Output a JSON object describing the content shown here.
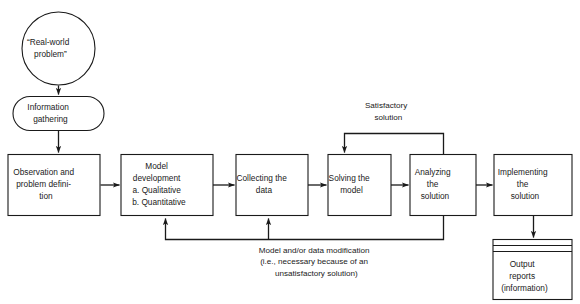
{
  "diagram": {
    "colors": {
      "stroke": "#1a1a1a",
      "fill": "#ffffff",
      "background": "#ffffff",
      "text": "#1a1a1a"
    },
    "nodes": {
      "real_world_problem": {
        "shape": "circle",
        "lines": [
          "“Real-world",
          "problem”"
        ]
      },
      "information_gathering": {
        "shape": "stadium",
        "lines": [
          "Information",
          "gathering"
        ]
      },
      "observation": {
        "shape": "rect",
        "lines": [
          "Observation and",
          "problem defini-",
          "tion"
        ]
      },
      "model_development": {
        "shape": "rect",
        "lines": [
          "Model",
          "development",
          "a. Qualitative",
          "b. Quantitative"
        ]
      },
      "collecting_data": {
        "shape": "rect",
        "lines": [
          "Collecting the",
          "data"
        ]
      },
      "solving_model": {
        "shape": "rect",
        "lines": [
          "Solving the",
          "model"
        ]
      },
      "analyzing_solution": {
        "shape": "rect",
        "lines": [
          "Analyzing",
          "the",
          "solution"
        ]
      },
      "implementing_solution": {
        "shape": "rect",
        "lines": [
          "Implementing",
          "the",
          "solution"
        ]
      },
      "output_reports": {
        "shape": "stacked-rect",
        "lines": [
          "Output",
          "reports",
          "(information)"
        ]
      }
    },
    "edge_labels": {
      "satisfactory": {
        "lines": [
          "Satisfactory",
          "solution"
        ]
      },
      "modification": {
        "lines": [
          "Model and/or data modification",
          "(i.e., necessary because of an",
          "unsatisfactory solution)"
        ]
      }
    }
  }
}
